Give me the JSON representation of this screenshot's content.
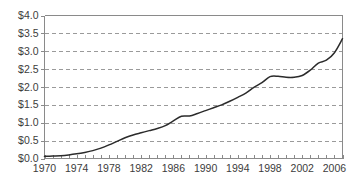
{
  "chart_data": {
    "type": "line",
    "title": "",
    "subtitle": "",
    "xlabel": "",
    "ylabel": "",
    "xlim": [
      1970,
      2007
    ],
    "ylim": [
      0.0,
      4.0
    ],
    "grid": true,
    "legend": null,
    "y_tick_labels": [
      "$0.0",
      "$0.5",
      "$1.0",
      "$1.5",
      "$2.0",
      "$2.5",
      "$3.0",
      "$3.5",
      "$4.0"
    ],
    "y_tick_values": [
      0.0,
      0.5,
      1.0,
      1.5,
      2.0,
      2.5,
      3.0,
      3.5,
      4.0
    ],
    "x_tick_labels": [
      "1970",
      "1974",
      "1978",
      "1982",
      "1986",
      "1990",
      "1994",
      "1998",
      "2002",
      "2006"
    ],
    "x_tick_values": [
      1970,
      1974,
      1978,
      1982,
      1986,
      1990,
      1994,
      1998,
      2002,
      2006
    ],
    "x_minor_ticks": [
      1970,
      1971,
      1972,
      1973,
      1974,
      1975,
      1976,
      1977,
      1978,
      1979,
      1980,
      1981,
      1982,
      1983,
      1984,
      1985,
      1986,
      1987,
      1988,
      1989,
      1990,
      1991,
      1992,
      1993,
      1994,
      1995,
      1996,
      1997,
      1998,
      1999,
      2000,
      2001,
      2002,
      2003,
      2004,
      2005,
      2006,
      2007
    ],
    "x": [
      1970,
      1971,
      1972,
      1973,
      1974,
      1975,
      1976,
      1977,
      1978,
      1979,
      1980,
      1981,
      1982,
      1983,
      1984,
      1985,
      1986,
      1987,
      1988,
      1989,
      1990,
      1991,
      1992,
      1993,
      1994,
      1995,
      1996,
      1997,
      1998,
      1999,
      2000,
      2001,
      2002,
      2003,
      2004,
      2005,
      2006,
      2007
    ],
    "values": [
      0.06,
      0.07,
      0.08,
      0.1,
      0.13,
      0.17,
      0.22,
      0.29,
      0.38,
      0.48,
      0.58,
      0.66,
      0.72,
      0.78,
      0.84,
      0.92,
      1.05,
      1.18,
      1.19,
      1.26,
      1.34,
      1.42,
      1.5,
      1.6,
      1.71,
      1.83,
      1.99,
      2.12,
      2.29,
      2.3,
      2.27,
      2.27,
      2.32,
      2.47,
      2.67,
      2.75,
      2.96,
      3.35
    ],
    "series": [
      {
        "name": "value",
        "color": "#2b2b2b",
        "values": [
          0.06,
          0.07,
          0.08,
          0.1,
          0.13,
          0.17,
          0.22,
          0.29,
          0.38,
          0.48,
          0.58,
          0.66,
          0.72,
          0.78,
          0.84,
          0.92,
          1.05,
          1.18,
          1.19,
          1.26,
          1.34,
          1.42,
          1.5,
          1.6,
          1.71,
          1.83,
          1.99,
          2.12,
          2.29,
          2.3,
          2.27,
          2.27,
          2.32,
          2.47,
          2.67,
          2.75,
          2.96,
          3.35
        ]
      }
    ],
    "colors": {
      "line": "#2b2b2b",
      "grid": "#9a9a9a",
      "axis": "#8a8a8a",
      "text": "#3c3c3c",
      "background": "#ffffff"
    }
  }
}
